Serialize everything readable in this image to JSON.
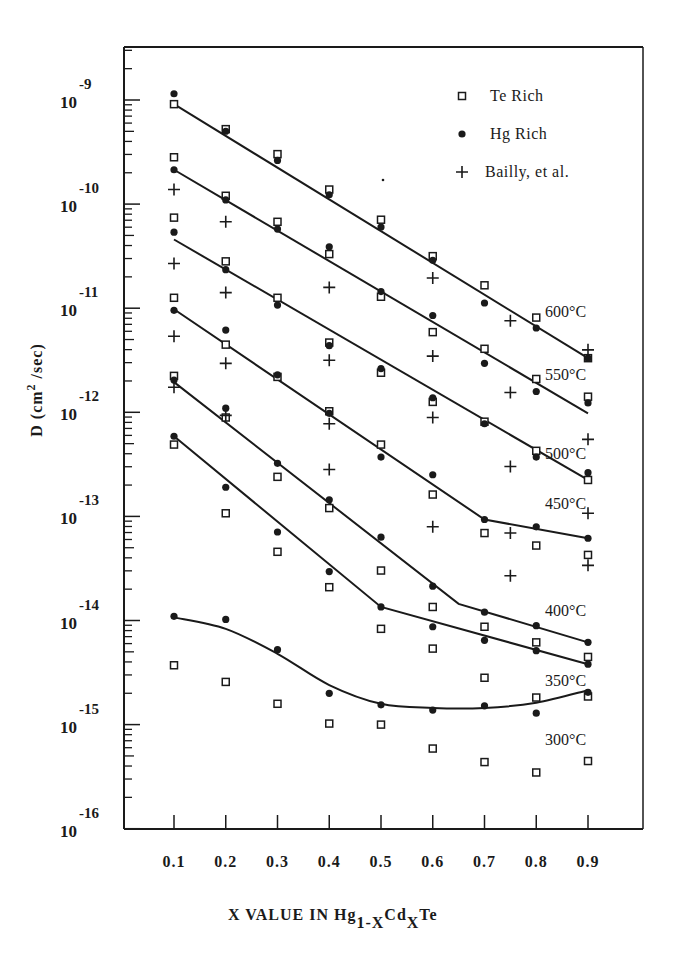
{
  "chart_data": {
    "type": "scatter",
    "title": "",
    "xlabel": "X VALUE IN Hg1-XCdXTe",
    "xlabel_parts": {
      "main": "X VALUE IN Hg",
      "sub1": "1-X",
      "mid": "Cd",
      "sub2": "X",
      "end": "Te"
    },
    "ylabel": "D (cm2/sec)",
    "ylabel_parts": {
      "main": "D (cm",
      "sup": "2",
      "end": " /sec)"
    },
    "yscale": "log",
    "ylim": [
      1e-16,
      3e-09
    ],
    "xlim": [
      0.0,
      1.0
    ],
    "grid": false,
    "legend_position": "upper right",
    "x_ticks": [
      "0.1",
      "0.2",
      "0.3",
      "0.4",
      "0.5",
      "0.6",
      "0.7",
      "0.8",
      "0.9"
    ],
    "y_ticks": [
      {
        "base": "10",
        "exp": "-9",
        "log": -9
      },
      {
        "base": "10",
        "exp": "-10",
        "log": -10
      },
      {
        "base": "10",
        "exp": "-11",
        "log": -11
      },
      {
        "base": "10",
        "exp": "-12",
        "log": -12
      },
      {
        "base": "10",
        "exp": "-13",
        "log": -13
      },
      {
        "base": "10",
        "exp": "-14",
        "log": -14
      },
      {
        "base": "10",
        "exp": "-15",
        "log": -15
      },
      {
        "base": "10",
        "exp": "-16",
        "log": -16
      }
    ],
    "legend": [
      {
        "name": "Te Rich",
        "marker": "open-square"
      },
      {
        "name": "Hg Rich",
        "marker": "filled-circle"
      },
      {
        "name": "Bailly, et al.",
        "marker": "plus"
      }
    ],
    "value_format": "log10(D)",
    "series": [
      {
        "name": "Te Rich",
        "marker": "open-square",
        "points": [
          [
            0.1,
            -9.04
          ],
          [
            0.1,
            -9.55
          ],
          [
            0.1,
            -10.13
          ],
          [
            0.1,
            -10.9
          ],
          [
            0.1,
            -11.65
          ],
          [
            0.1,
            -12.31
          ],
          [
            0.1,
            -14.43
          ],
          [
            0.2,
            -9.28
          ],
          [
            0.2,
            -9.92
          ],
          [
            0.2,
            -10.55
          ],
          [
            0.2,
            -11.35
          ],
          [
            0.2,
            -12.05
          ],
          [
            0.2,
            -12.97
          ],
          [
            0.2,
            -14.59
          ],
          [
            0.3,
            -9.52
          ],
          [
            0.3,
            -10.17
          ],
          [
            0.3,
            -10.9
          ],
          [
            0.3,
            -11.66
          ],
          [
            0.3,
            -12.62
          ],
          [
            0.3,
            -13.34
          ],
          [
            0.3,
            -14.8
          ],
          [
            0.4,
            -9.86
          ],
          [
            0.4,
            -10.48
          ],
          [
            0.4,
            -11.33
          ],
          [
            0.4,
            -11.99
          ],
          [
            0.4,
            -12.92
          ],
          [
            0.4,
            -13.68
          ],
          [
            0.4,
            -14.99
          ],
          [
            0.5,
            -10.15
          ],
          [
            0.5,
            -10.89
          ],
          [
            0.5,
            -11.62
          ],
          [
            0.5,
            -12.31
          ],
          [
            0.5,
            -13.52
          ],
          [
            0.5,
            -14.08
          ],
          [
            0.5,
            -15.0
          ],
          [
            0.6,
            -10.5
          ],
          [
            0.6,
            -11.23
          ],
          [
            0.6,
            -11.9
          ],
          [
            0.6,
            -12.79
          ],
          [
            0.6,
            -13.87
          ],
          [
            0.6,
            -14.27
          ],
          [
            0.6,
            -15.23
          ],
          [
            0.7,
            -10.78
          ],
          [
            0.7,
            -11.39
          ],
          [
            0.7,
            -12.09
          ],
          [
            0.7,
            -13.16
          ],
          [
            0.7,
            -14.06
          ],
          [
            0.7,
            -14.55
          ],
          [
            0.7,
            -15.36
          ],
          [
            0.8,
            -11.09
          ],
          [
            0.8,
            -11.68
          ],
          [
            0.8,
            -12.37
          ],
          [
            0.8,
            -13.28
          ],
          [
            0.8,
            -14.21
          ],
          [
            0.8,
            -14.74
          ],
          [
            0.8,
            -15.46
          ],
          [
            0.9,
            -11.48
          ],
          [
            0.9,
            -11.85
          ],
          [
            0.9,
            -12.65
          ],
          [
            0.9,
            -13.37
          ],
          [
            0.9,
            -14.35
          ],
          [
            0.9,
            -14.73
          ],
          [
            0.9,
            -15.35
          ]
        ]
      },
      {
        "name": "Hg Rich",
        "marker": "filled-circle",
        "points": [
          [
            0.1,
            -8.94
          ],
          [
            0.1,
            -9.67
          ],
          [
            0.1,
            -10.27
          ],
          [
            0.1,
            -11.02
          ],
          [
            0.1,
            -11.69
          ],
          [
            0.1,
            -12.23
          ],
          [
            0.1,
            -13.96
          ],
          [
            0.2,
            -9.3
          ],
          [
            0.2,
            -9.96
          ],
          [
            0.2,
            -10.63
          ],
          [
            0.2,
            -11.21
          ],
          [
            0.2,
            -11.96
          ],
          [
            0.2,
            -12.72
          ],
          [
            0.2,
            -13.99
          ],
          [
            0.3,
            -9.58
          ],
          [
            0.3,
            -10.24
          ],
          [
            0.3,
            -10.97
          ],
          [
            0.3,
            -11.64
          ],
          [
            0.3,
            -12.49
          ],
          [
            0.3,
            -13.15
          ],
          [
            0.3,
            -14.28
          ],
          [
            0.4,
            -9.91
          ],
          [
            0.4,
            -10.41
          ],
          [
            0.4,
            -11.36
          ],
          [
            0.4,
            -12.01
          ],
          [
            0.4,
            -12.84
          ],
          [
            0.4,
            -13.53
          ],
          [
            0.4,
            -14.7
          ],
          [
            0.5,
            -10.22
          ],
          [
            0.5,
            -10.84
          ],
          [
            0.5,
            -11.58
          ],
          [
            0.5,
            -12.43
          ],
          [
            0.5,
            -13.2
          ],
          [
            0.5,
            -13.87
          ],
          [
            0.5,
            -14.81
          ],
          [
            0.6,
            -10.54
          ],
          [
            0.6,
            -11.07
          ],
          [
            0.6,
            -11.86
          ],
          [
            0.6,
            -12.6
          ],
          [
            0.6,
            -13.67
          ],
          [
            0.6,
            -14.06
          ],
          [
            0.6,
            -14.86
          ],
          [
            0.7,
            -10.95
          ],
          [
            0.7,
            -11.53
          ],
          [
            0.7,
            -12.11
          ],
          [
            0.7,
            -13.03
          ],
          [
            0.7,
            -14.19
          ],
          [
            0.7,
            -13.92
          ],
          [
            0.7,
            -14.82
          ],
          [
            0.8,
            -11.19
          ],
          [
            0.8,
            -11.8
          ],
          [
            0.8,
            -12.43
          ],
          [
            0.8,
            -13.1
          ],
          [
            0.8,
            -14.05
          ],
          [
            0.8,
            -14.29
          ],
          [
            0.8,
            -14.89
          ],
          [
            0.9,
            -11.48
          ],
          [
            0.9,
            -11.91
          ],
          [
            0.9,
            -12.58
          ],
          [
            0.9,
            -13.21
          ],
          [
            0.9,
            -14.21
          ],
          [
            0.9,
            -14.42
          ],
          [
            0.9,
            -14.69
          ]
        ]
      },
      {
        "name": "Bailly, et al.",
        "marker": "plus",
        "points": [
          [
            0.1,
            -9.86
          ],
          [
            0.1,
            -10.57
          ],
          [
            0.1,
            -11.27
          ],
          [
            0.1,
            -11.76
          ],
          [
            0.2,
            -10.17
          ],
          [
            0.2,
            -10.85
          ],
          [
            0.2,
            -11.53
          ],
          [
            0.2,
            -12.03
          ],
          [
            0.4,
            -10.8
          ],
          [
            0.4,
            -11.5
          ],
          [
            0.4,
            -12.11
          ],
          [
            0.4,
            -12.55
          ],
          [
            0.6,
            -10.71
          ],
          [
            0.6,
            -11.46
          ],
          [
            0.6,
            -12.05
          ],
          [
            0.6,
            -13.1
          ],
          [
            0.75,
            -11.12
          ],
          [
            0.75,
            -11.81
          ],
          [
            0.75,
            -12.52
          ],
          [
            0.75,
            -13.16
          ],
          [
            0.75,
            -13.57
          ],
          [
            0.9,
            -11.4
          ],
          [
            0.9,
            -12.26
          ],
          [
            0.9,
            -12.97
          ],
          [
            0.9,
            -13.47
          ]
        ]
      }
    ],
    "fit_lines": [
      {
        "label": "600°C",
        "label_log": -11.03,
        "points": [
          [
            0.1,
            -9.04
          ],
          [
            0.9,
            -11.48
          ]
        ]
      },
      {
        "label": "550°C",
        "label_log": -11.63,
        "points": [
          [
            0.1,
            -9.67
          ],
          [
            0.9,
            -12.01
          ]
        ]
      },
      {
        "label": "500°C",
        "label_log": -12.39,
        "points": [
          [
            0.1,
            -10.34
          ],
          [
            0.9,
            -12.65
          ]
        ]
      },
      {
        "label": "450°C",
        "label_log": -12.87,
        "points": [
          [
            0.1,
            -11.01
          ],
          [
            0.7,
            -13.03
          ],
          [
            0.9,
            -13.21
          ]
        ]
      },
      {
        "label": "400°C",
        "label_log": -13.9,
        "points": [
          [
            0.1,
            -11.71
          ],
          [
            0.65,
            -13.84
          ],
          [
            0.9,
            -14.21
          ]
        ]
      },
      {
        "label": "350°C",
        "label_log": -14.57,
        "points": [
          [
            0.1,
            -12.23
          ],
          [
            0.5,
            -13.87
          ],
          [
            0.9,
            -14.42
          ]
        ]
      },
      {
        "label": "300°C",
        "label_log": -15.14,
        "points": [
          [
            0.1,
            -13.97
          ],
          [
            0.2,
            -14.08
          ],
          [
            0.3,
            -14.32
          ],
          [
            0.4,
            -14.62
          ],
          [
            0.5,
            -14.8
          ],
          [
            0.6,
            -14.84
          ],
          [
            0.7,
            -14.84
          ],
          [
            0.8,
            -14.79
          ],
          [
            0.9,
            -14.67
          ]
        ],
        "smooth": true
      }
    ]
  }
}
